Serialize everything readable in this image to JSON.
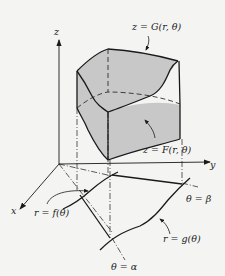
{
  "figure": {
    "axes": {
      "x": "x",
      "y": "y",
      "z": "z"
    },
    "labels": {
      "upper_surface": "z = G(r, θ)",
      "lower_surface": "z = F(r, θ)",
      "inner_curve": "r = f(θ)",
      "outer_curve": "r = g(θ)",
      "ray_alpha": "θ = α",
      "ray_beta": "θ = β"
    },
    "colors": {
      "fill": "#c8c8c8",
      "stroke": "#1a1a1a",
      "background": "#f4f4f2"
    }
  }
}
